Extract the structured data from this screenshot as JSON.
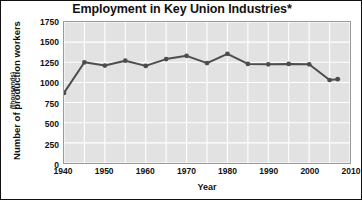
{
  "chart_data": {
    "type": "line",
    "title": "Employment in Key Union Industries*",
    "xlabel": "Year",
    "ylabel": "Number of production workers",
    "ylabel_sub": "(thousands)",
    "xlim": [
      1940,
      2010
    ],
    "ylim": [
      0,
      1750
    ],
    "yticks": [
      1750,
      1500,
      1250,
      1000,
      750,
      500,
      250,
      0
    ],
    "xticks": [
      1940,
      1950,
      1960,
      1970,
      1980,
      1990,
      2000,
      2010
    ],
    "grid": true,
    "grid_x_step": 5,
    "grid_y_step": 250,
    "legend": "none",
    "series": [
      {
        "name": "Production workers",
        "color": "#4d4d4d",
        "marker": "circle",
        "x": [
          1940,
          1945,
          1950,
          1955,
          1960,
          1965,
          1970,
          1975,
          1980,
          1985,
          1990,
          1995,
          2000,
          2005,
          2007
        ],
        "values": [
          870,
          1250,
          1210,
          1270,
          1205,
          1290,
          1330,
          1240,
          1355,
          1230,
          1225,
          1230,
          1225,
          1030,
          1040
        ]
      }
    ]
  },
  "figure": {
    "footnote_marker": "*",
    "plot_background": "#e2e2e2",
    "grid_color": "#ffffff",
    "line_color": "#4d4d4d",
    "border_color": "#111111"
  }
}
